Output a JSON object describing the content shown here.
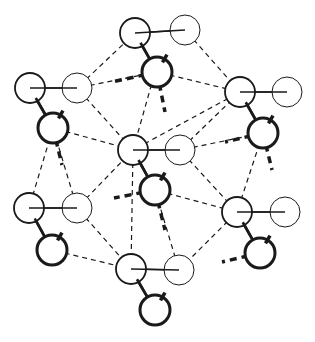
{
  "diagram": {
    "title": "",
    "background": "#ffffff",
    "stroke_color": "#1a1a1a",
    "units": [
      {
        "id": "top",
        "big": [
          135,
          33
        ],
        "light": [
          185,
          30
        ],
        "dark": [
          157,
          72
        ]
      },
      {
        "id": "left-upper",
        "big": [
          30,
          88
        ],
        "light": [
          77,
          88
        ],
        "dark": [
          53,
          128
        ]
      },
      {
        "id": "right-upper",
        "big": [
          240,
          92
        ],
        "light": [
          287,
          92
        ],
        "dark": [
          263,
          133
        ]
      },
      {
        "id": "center",
        "big": [
          133,
          150
        ],
        "light": [
          180,
          150
        ],
        "dark": [
          155,
          190
        ]
      },
      {
        "id": "left-lower",
        "big": [
          29,
          208
        ],
        "light": [
          77,
          208
        ],
        "dark": [
          52,
          250
        ]
      },
      {
        "id": "right-lower",
        "big": [
          237,
          212
        ],
        "light": [
          285,
          212
        ],
        "dark": [
          260,
          253
        ]
      },
      {
        "id": "bottom",
        "big": [
          131,
          269
        ],
        "light": [
          179,
          270
        ],
        "dark": [
          155,
          310
        ]
      }
    ],
    "radius": 15,
    "thin_dashed_links": [
      [
        [
          77,
          88
        ],
        [
          135,
          33
        ]
      ],
      [
        [
          77,
          88
        ],
        [
          157,
          72
        ]
      ],
      [
        [
          77,
          88
        ],
        [
          133,
          150
        ]
      ],
      [
        [
          185,
          30
        ],
        [
          240,
          92
        ]
      ],
      [
        [
          157,
          72
        ],
        [
          240,
          92
        ]
      ],
      [
        [
          133,
          150
        ],
        [
          240,
          92
        ]
      ],
      [
        [
          180,
          150
        ],
        [
          240,
          92
        ]
      ],
      [
        [
          180,
          150
        ],
        [
          237,
          212
        ]
      ],
      [
        [
          53,
          128
        ],
        [
          133,
          150
        ]
      ],
      [
        [
          77,
          208
        ],
        [
          133,
          150
        ]
      ],
      [
        [
          77,
          208
        ],
        [
          131,
          269
        ]
      ],
      [
        [
          180,
          150
        ],
        [
          263,
          133
        ]
      ],
      [
        [
          237,
          212
        ],
        [
          179,
          270
        ]
      ],
      [
        [
          29,
          208
        ],
        [
          53,
          128
        ]
      ],
      [
        [
          77,
          208
        ],
        [
          53,
          128
        ]
      ],
      [
        [
          237,
          212
        ],
        [
          263,
          133
        ]
      ],
      [
        [
          155,
          72
        ],
        [
          133,
          150
        ]
      ],
      [
        [
          52,
          250
        ],
        [
          131,
          269
        ]
      ],
      [
        [
          133,
          150
        ],
        [
          131,
          269
        ]
      ],
      [
        [
          237,
          212
        ],
        [
          155,
          190
        ]
      ],
      [
        [
          179,
          270
        ],
        [
          155,
          190
        ]
      ]
    ],
    "thick_dashed_links": [
      [
        [
          157,
          72
        ],
        [
          112,
          82
        ]
      ],
      [
        [
          157,
          72
        ],
        [
          165,
          112
        ]
      ],
      [
        [
          53,
          128
        ],
        [
          62,
          165
        ]
      ],
      [
        [
          263,
          133
        ],
        [
          272,
          170
        ]
      ],
      [
        [
          263,
          133
        ],
        [
          225,
          142
        ]
      ],
      [
        [
          155,
          190
        ],
        [
          114,
          198
        ]
      ],
      [
        [
          155,
          190
        ],
        [
          165,
          230
        ]
      ],
      [
        [
          260,
          253
        ],
        [
          222,
          262
        ]
      ]
    ]
  }
}
